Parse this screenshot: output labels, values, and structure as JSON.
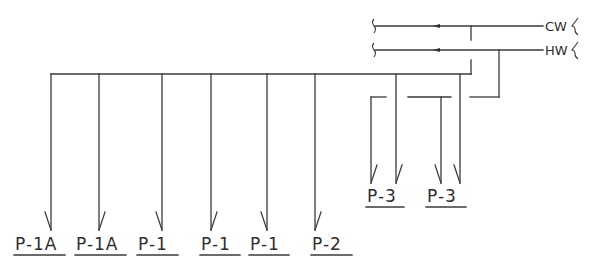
{
  "diagram": {
    "type": "plumbing-riser-schematic",
    "supply_lines": [
      {
        "id": "cw",
        "label": "CW",
        "name": "Cold Water",
        "y": 26,
        "flow_direction": "left"
      },
      {
        "id": "hw",
        "label": "HW",
        "name": "Hot Water",
        "y": 50,
        "flow_direction": "left"
      }
    ],
    "fixtures": [
      {
        "label": "P-1A",
        "x": 51,
        "supply": "cold",
        "arrow_side": "left"
      },
      {
        "label": "P-1A",
        "x": 99,
        "supply": "cold",
        "arrow_side": "right"
      },
      {
        "label": "P-1",
        "x": 162,
        "supply": "cold",
        "arrow_side": "left"
      },
      {
        "label": "P-1",
        "x": 211,
        "supply": "cold",
        "arrow_side": "right"
      },
      {
        "label": "P-1",
        "x": 267,
        "supply": "cold",
        "arrow_side": "left"
      },
      {
        "label": "P-2",
        "x": 315,
        "supply": "cold",
        "arrow_side": "right"
      }
    ],
    "fixtures_p3": [
      {
        "label": "P-3",
        "hot_x": 371,
        "cold_x": 396
      },
      {
        "label": "P-3",
        "hot_x": 441,
        "cold_x": 460
      }
    ],
    "colors": {
      "line": "#3a3a3a",
      "text": "#2e2e2e",
      "background": "#ffffff"
    }
  }
}
